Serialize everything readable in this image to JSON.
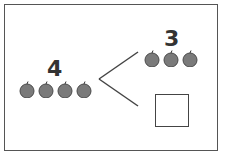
{
  "diagram": {
    "type": "number-bond",
    "whole": {
      "value": "4",
      "apple_count": 4
    },
    "parts": [
      {
        "value": "3",
        "apple_count": 3
      },
      {
        "value": "",
        "apple_count": 0,
        "blank_box": true
      }
    ]
  },
  "colors": {
    "apple_fill": "#7a7a7a",
    "apple_outline": "#4a4a4a",
    "line": "#444444"
  }
}
